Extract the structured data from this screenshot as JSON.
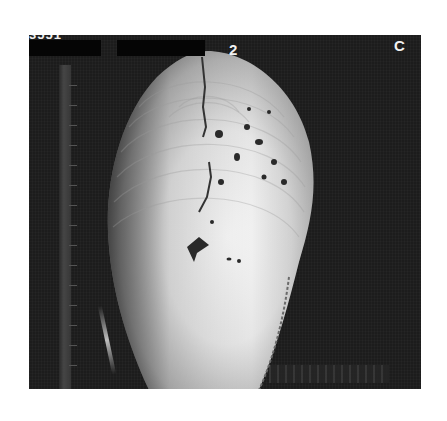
{
  "image": {
    "description": "Grayscale photograph of a bivalve shell on a dark background with a measuring scale along the left and bottom edges",
    "labels": {
      "top_left_clipped": "3551",
      "panel_number": "2",
      "panel_letter": "C"
    },
    "redaction_bars": 2,
    "colors": {
      "background": "#1c1c1c",
      "shell_highlight": "#f4f4f4",
      "shell_shadow": "#6a6a6a",
      "page": "#ffffff",
      "label": "#f2f2f2"
    }
  }
}
